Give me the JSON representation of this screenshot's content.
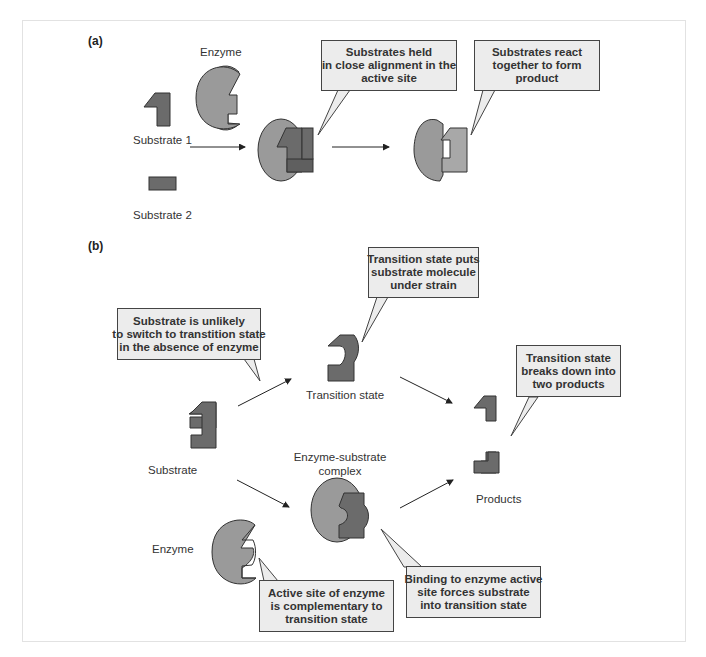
{
  "panel_a": {
    "label": "(a)",
    "enzyme_label": "Enzyme",
    "substrate1_label": "Substrate 1",
    "substrate2_label": "Substrate 2",
    "callout_held": [
      "Substrates held",
      "in close alignment in the",
      "active site"
    ],
    "callout_react": [
      "Substrates react",
      "together to form",
      "product"
    ]
  },
  "panel_b": {
    "label": "(b)",
    "substrate_label": "Substrate",
    "enzyme_label": "Enzyme",
    "transition_state_label": "Transition state",
    "complex_label": [
      "Enzyme-substrate",
      "complex"
    ],
    "products_label": "Products",
    "callout_unlikely": [
      "Substrate is unlikely",
      "to switch to transtition state",
      "in the absence of enzyme"
    ],
    "callout_strain": [
      "Transition state puts",
      "substrate molecule",
      "under strain"
    ],
    "callout_breaks": [
      "Transition state",
      "breaks down into",
      "two products"
    ],
    "callout_active_site": [
      "Active site of enzyme",
      "is complementary to",
      "transition state"
    ],
    "callout_binding": [
      "Binding to enzyme active",
      "site forces substrate",
      "into transition state"
    ]
  },
  "colors": {
    "enzyme_fill": "#9a9a9a",
    "substrate_fill": "#6b6b6b",
    "callout_fill": "#ececec",
    "outline": "#333333",
    "frame_border": "#e2e2e2"
  }
}
